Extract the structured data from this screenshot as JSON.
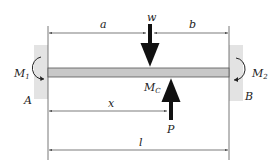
{
  "diagram": {
    "type": "fixed-fixed beam with point load and point force",
    "labels": {
      "a": "a",
      "b": "b",
      "w": "w",
      "M1": "M",
      "M1_sub": "1",
      "M2": "M",
      "M2_sub": "2",
      "MC": "M",
      "MC_sub": "C",
      "A": "A",
      "B": "B",
      "x": "x",
      "P": "P",
      "l": "l"
    },
    "colors": {
      "wall": "#e3e3e3",
      "beam_fill": "#c8c8c8",
      "beam_stroke": "#555555",
      "arrow": "#111111",
      "line": "#444444"
    }
  }
}
